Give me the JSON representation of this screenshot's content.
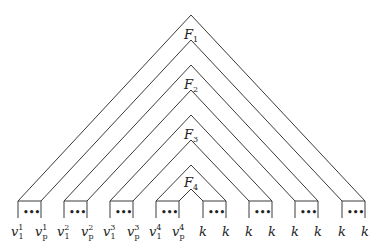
{
  "diagram": {
    "type": "nested-triangles",
    "formulas": [
      {
        "name": "F",
        "index": "1"
      },
      {
        "name": "F",
        "index": "2"
      },
      {
        "name": "F",
        "index": "3"
      },
      {
        "name": "F",
        "index": "4"
      }
    ],
    "leaves": [
      {
        "left": "v",
        "left_sup": "1",
        "left_sub": "1",
        "right": "v",
        "right_sup": "1",
        "right_sub": "p"
      },
      {
        "left": "v",
        "left_sup": "2",
        "left_sub": "1",
        "right": "v",
        "right_sup": "2",
        "right_sub": "p"
      },
      {
        "left": "v",
        "left_sup": "3",
        "left_sub": "1",
        "right": "v",
        "right_sup": "3",
        "right_sub": "p"
      },
      {
        "left": "v",
        "left_sup": "4",
        "left_sub": "1",
        "right": "v",
        "right_sup": "4",
        "right_sub": "p"
      },
      {
        "left": "k",
        "right": "k"
      },
      {
        "left": "k",
        "right": "k"
      },
      {
        "left": "k",
        "right": "k"
      },
      {
        "left": "k",
        "right": "k"
      }
    ],
    "ellipsis": "•••"
  }
}
